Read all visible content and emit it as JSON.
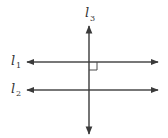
{
  "diagram": {
    "colors": {
      "line": "#4a4a4a",
      "background": "#ffffff",
      "text": "#333333"
    },
    "lines": [
      {
        "id": "l1",
        "label_base": "l",
        "label_sub": "1",
        "orientation": "horizontal",
        "y": 62,
        "x1": 27,
        "x2": 158
      },
      {
        "id": "l2",
        "label_base": "l",
        "label_sub": "2",
        "orientation": "horizontal",
        "y": 90,
        "x1": 27,
        "x2": 158
      },
      {
        "id": "l3",
        "label_base": "l",
        "label_sub": "3",
        "orientation": "vertical",
        "x": 89,
        "y1": 26,
        "y2": 134
      }
    ],
    "annotations": [
      {
        "type": "right-angle-mark",
        "at": "intersection of l1 and l3",
        "quadrant": "lower-right"
      }
    ]
  }
}
